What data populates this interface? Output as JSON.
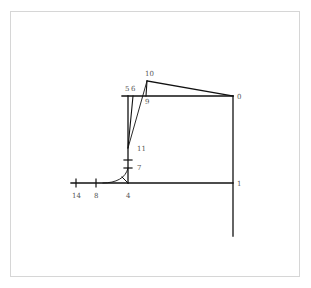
{
  "diagram": {
    "type": "pattern-drafting-construction",
    "line_color": "#111111",
    "label_color": "#555555",
    "frame_color": "#d6d6d6",
    "labels": {
      "p0": "0",
      "p1": "1",
      "p4": "4",
      "p5": "5",
      "p6": "6",
      "p7": "7",
      "p8": "8",
      "p9": "9",
      "p10": "10",
      "p11": "11",
      "p14": "14"
    }
  }
}
